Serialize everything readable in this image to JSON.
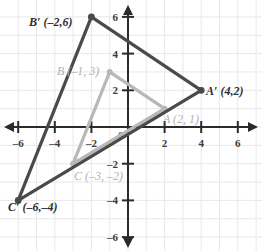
{
  "chart_data": {
    "type": "scatter",
    "title": "",
    "xlabel": "",
    "ylabel": "",
    "xlim": [
      -7.0,
      7.3
    ],
    "ylim": [
      -7.0,
      6.9
    ],
    "grid": true,
    "legend": false,
    "x_ticks": [
      "-6",
      "-4",
      "-2",
      "2",
      "4",
      "6"
    ],
    "x_tick_values": [
      -6,
      -4,
      -2,
      2,
      4,
      6
    ],
    "y_ticks": [
      "6",
      "4",
      "2",
      "-2",
      "-4",
      "-6"
    ],
    "y_tick_values": [
      6,
      4,
      2,
      -2,
      -4,
      -6
    ],
    "origin_label": "0",
    "series": [
      {
        "name": "preimage-triangle-ABC",
        "color": "#b8b8b8",
        "points": [
          {
            "id": "A",
            "label": "A (2, 1)",
            "x": 2,
            "y": 1
          },
          {
            "id": "B",
            "label": "B (-1, 3)",
            "x": -1,
            "y": 3
          },
          {
            "id": "C",
            "label": "C (-3, -2)",
            "x": -3,
            "y": -2
          }
        ]
      },
      {
        "name": "image-triangle-A-prime-B-prime-C-prime",
        "color": "#4a4a4a",
        "points": [
          {
            "id": "A'",
            "label": "A′ (4,2)",
            "x": 4,
            "y": 2
          },
          {
            "id": "B'",
            "label": "B′ (–2,6)",
            "x": -2,
            "y": 6
          },
          {
            "id": "C'",
            "label": "C′ (–6,–4)",
            "x": -6,
            "y": -4
          }
        ]
      }
    ],
    "annotations": [
      {
        "name": "label-B-prime",
        "text": "B′ (–2,6)",
        "style": "dark",
        "x": 29,
        "y": 26
      },
      {
        "name": "label-A-prime",
        "text": "A′ (4,2)",
        "style": "dark",
        "x": 206,
        "y": 95
      },
      {
        "name": "label-C-prime",
        "text": "C′ (–6,–4)",
        "style": "dark",
        "x": 8,
        "y": 211
      },
      {
        "name": "label-B",
        "text": "B (–1, 3)",
        "style": "light",
        "x": 57,
        "y": 75
      },
      {
        "name": "label-A",
        "text": "A (2, 1)",
        "style": "light",
        "x": 163,
        "y": 123
      },
      {
        "name": "label-C",
        "text": "C (–3, –2)",
        "style": "light",
        "x": 74,
        "y": 180
      }
    ]
  },
  "colors": {
    "background": "#ffffff",
    "grid": "#e8e8ea",
    "axis": "#2b2b2b",
    "dark_triangle": "#4a4a4a",
    "light_triangle": "#b8b8b8",
    "tick_text": "#3b3b3b",
    "light_text": "#b3b3b3"
  }
}
